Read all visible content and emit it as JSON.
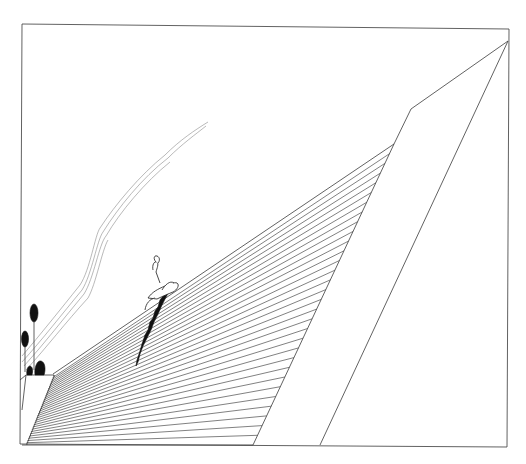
{
  "artwork": {
    "subject": "line drawing of a hatched ramp and wall with a small figure and a dark crevice",
    "elements": [
      "frame",
      "hatched-slope",
      "wall-slab",
      "sky-streak",
      "figure",
      "crevice",
      "trees",
      "ledge"
    ],
    "hatch_line_count": 30,
    "colors": {
      "background": "#ffffff",
      "line": "#3a3a3a",
      "ink": "#111111",
      "sky_streak": "#8a8a8a"
    }
  }
}
